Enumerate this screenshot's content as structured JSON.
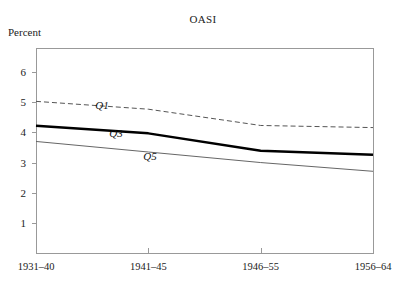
{
  "chart_data": {
    "type": "line",
    "title": "OASI",
    "ylabel": "Percent",
    "xlabel": "",
    "grid": false,
    "legend": "inline-labels",
    "categories": [
      "1931–40",
      "1941–45",
      "1946–55",
      "1956–64"
    ],
    "x": [
      0,
      1,
      2,
      3
    ],
    "ylim": [
      0,
      6.8
    ],
    "yticks": [
      1,
      2,
      3,
      4,
      5,
      6
    ],
    "ytick_labels": [
      "1",
      "2",
      "3",
      "4",
      "5",
      "6"
    ],
    "series": [
      {
        "name": "Q1",
        "label": "Q1",
        "style": "dashed",
        "color": "#555555",
        "width": 1,
        "values": [
          5.03,
          4.77,
          4.23,
          4.16
        ]
      },
      {
        "name": "Q3",
        "label": "Q3",
        "style": "solid-bold",
        "color": "#000000",
        "width": 2.4,
        "values": [
          4.22,
          3.97,
          3.39,
          3.26
        ]
      },
      {
        "name": "Q5",
        "label": "Q5",
        "style": "solid-thin",
        "color": "#666666",
        "width": 1,
        "values": [
          3.7,
          3.35,
          3.0,
          2.71
        ]
      }
    ],
    "series_label_positions": [
      {
        "name": "Q1",
        "x_px": 102,
        "y_px": 105
      },
      {
        "name": "Q3",
        "x_px": 116,
        "y_px": 133
      },
      {
        "name": "Q5",
        "x_px": 150,
        "y_px": 156
      }
    ],
    "plot_frame": {
      "left_px": 36,
      "right_px": 373,
      "top_px": 48,
      "bottom_px": 253
    },
    "axis_color": "#999999",
    "background_color": "#ffffff"
  }
}
